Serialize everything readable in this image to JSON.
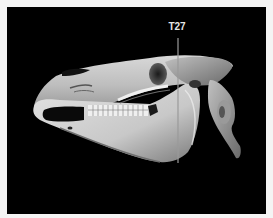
{
  "image": {
    "subject": "3D CT volume rendering of a horse skull, lateral view",
    "background_color": "#000000",
    "frame_color": "#f4f4f4"
  },
  "marker": {
    "label": "T27",
    "color": "#9a9a9a",
    "x": 178,
    "y_start": 38,
    "y_end": 163
  }
}
